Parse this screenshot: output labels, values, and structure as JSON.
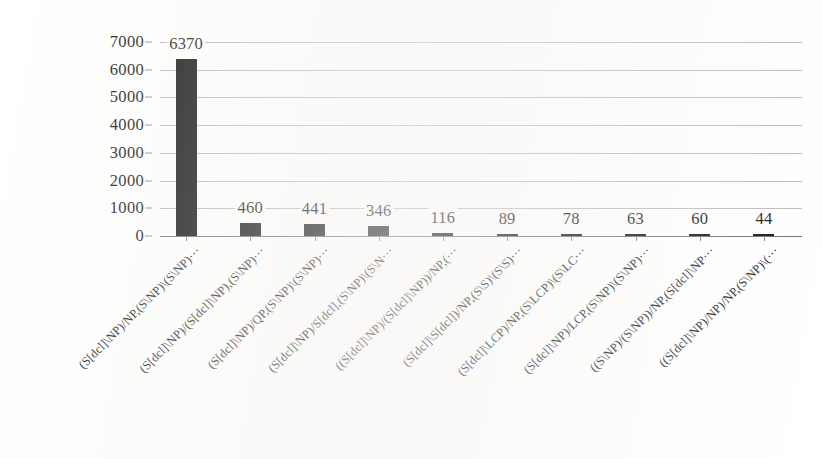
{
  "chart_data": {
    "type": "bar",
    "title": "",
    "subtitle": "",
    "xlabel": "",
    "ylabel": "",
    "ylim": [
      0,
      7000
    ],
    "ytick_interval": 1000,
    "ytick_labels": [
      "0",
      "1000",
      "2000",
      "3000",
      "4000",
      "5000",
      "6000",
      "7000"
    ],
    "ytick_values": [
      0,
      1000,
      2000,
      3000,
      4000,
      5000,
      6000,
      7000
    ],
    "grid": true,
    "grid_axis": "y",
    "legend": false,
    "legend_position": "none",
    "orientation": "vertical",
    "bar_color": "#0b0b0b",
    "value_labels_shown": true,
    "categories": [
      "(S[dcl]\\NP)/NP,(S\\NP)\\(S\\NP)···",
      "(S[dcl]\\NP)/(S[dcl]\\NP),(S\\NP)···",
      "(S[dcl]\\NP)/QP,(S\\NP)\\(S\\NP)···",
      "(S[dcl]\\NP)/S[dcl],(S\\NP)\\(S\\N···",
      "((S[dcl]\\NP)/(S[dcl]\\NP))/NP,(···",
      "(S[dcl]\\S[dcl])/NP,(S\\S)\\(S\\S)···",
      "(S[dcl]\\LCP)/NP,(S\\LCP)\\(S\\LC···",
      "(S[dcl]\\NP)/LCP,(S\\NP)\\(S\\NP)···",
      "((S\\NP)/(S\\NP))/NP,(S[dcl]\\NP···",
      "((S[dcl]\\NP)/NP)/NP,(S\\NP)\\(···"
    ],
    "values": [
      6370,
      460,
      441,
      346,
      116,
      89,
      78,
      63,
      60,
      44
    ],
    "value_labels": [
      "6370",
      "460",
      "441",
      "346",
      "116",
      "89",
      "78",
      "63",
      "60",
      "44"
    ]
  }
}
